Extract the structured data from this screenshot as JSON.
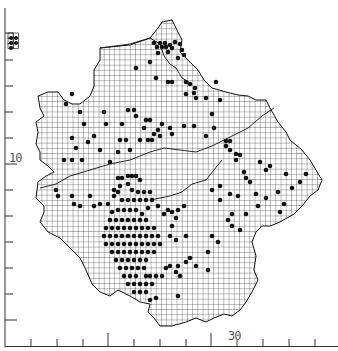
{
  "map": {
    "title": "",
    "grid_cell_px": 5.2,
    "colors": {
      "background": "#ffffff",
      "grid": "#222222",
      "outline": "#111111",
      "dot": "#111111",
      "axis": "#333333",
      "label": "#555555"
    },
    "axis": {
      "y_label": "10",
      "x_label": "30",
      "y_ticks_px": [
        33,
        60,
        86,
        112,
        138,
        164,
        190,
        216,
        242,
        268,
        294,
        320
      ],
      "x_ticks_px": [
        31,
        57,
        83,
        108,
        134,
        160,
        186,
        211,
        237,
        263,
        289,
        315
      ]
    },
    "outline": [
      [
        100,
        48
      ],
      [
        130,
        45
      ],
      [
        150,
        38
      ],
      [
        158,
        28
      ],
      [
        162,
        22
      ],
      [
        172,
        20
      ],
      [
        178,
        32
      ],
      [
        182,
        40
      ],
      [
        180,
        52
      ],
      [
        190,
        62
      ],
      [
        198,
        70
      ],
      [
        204,
        80
      ],
      [
        212,
        88
      ],
      [
        226,
        92
      ],
      [
        238,
        95
      ],
      [
        248,
        96
      ],
      [
        256,
        100
      ],
      [
        266,
        100
      ],
      [
        270,
        108
      ],
      [
        278,
        122
      ],
      [
        286,
        132
      ],
      [
        290,
        140
      ],
      [
        302,
        150
      ],
      [
        310,
        160
      ],
      [
        316,
        170
      ],
      [
        322,
        180
      ],
      [
        318,
        190
      ],
      [
        310,
        196
      ],
      [
        302,
        206
      ],
      [
        294,
        214
      ],
      [
        280,
        222
      ],
      [
        270,
        226
      ],
      [
        262,
        226
      ],
      [
        256,
        232
      ],
      [
        252,
        242
      ],
      [
        256,
        256
      ],
      [
        254,
        270
      ],
      [
        258,
        280
      ],
      [
        252,
        292
      ],
      [
        246,
        302
      ],
      [
        240,
        310
      ],
      [
        232,
        316
      ],
      [
        224,
        314
      ],
      [
        214,
        318
      ],
      [
        206,
        322
      ],
      [
        196,
        318
      ],
      [
        186,
        322
      ],
      [
        172,
        326
      ],
      [
        160,
        326
      ],
      [
        154,
        318
      ],
      [
        148,
        312
      ],
      [
        150,
        304
      ],
      [
        140,
        302
      ],
      [
        130,
        296
      ],
      [
        118,
        290
      ],
      [
        110,
        296
      ],
      [
        100,
        292
      ],
      [
        92,
        284
      ],
      [
        86,
        270
      ],
      [
        80,
        258
      ],
      [
        72,
        250
      ],
      [
        60,
        238
      ],
      [
        48,
        232
      ],
      [
        40,
        222
      ],
      [
        44,
        212
      ],
      [
        44,
        206
      ],
      [
        36,
        198
      ],
      [
        38,
        182
      ],
      [
        46,
        176
      ],
      [
        54,
        172
      ],
      [
        48,
        166
      ],
      [
        40,
        160
      ],
      [
        40,
        152
      ],
      [
        36,
        144
      ],
      [
        38,
        132
      ],
      [
        36,
        122
      ],
      [
        44,
        116
      ],
      [
        40,
        108
      ],
      [
        38,
        96
      ],
      [
        48,
        92
      ],
      [
        58,
        92
      ],
      [
        64,
        100
      ],
      [
        72,
        104
      ],
      [
        80,
        104
      ],
      [
        90,
        96
      ],
      [
        94,
        86
      ],
      [
        94,
        70
      ],
      [
        100,
        60
      ]
    ],
    "inner_boundaries": [
      [
        [
          100,
          48
        ],
        [
          130,
          44
        ],
        [
          150,
          38
        ],
        [
          160,
          44
        ],
        [
          164,
          56
        ],
        [
          170,
          64
        ],
        [
          176,
          68
        ],
        [
          182,
          78
        ],
        [
          192,
          84
        ]
      ],
      [
        [
          40,
          188
        ],
        [
          56,
          184
        ],
        [
          70,
          176
        ],
        [
          90,
          170
        ],
        [
          110,
          164
        ],
        [
          130,
          160
        ],
        [
          150,
          152
        ],
        [
          164,
          148
        ],
        [
          180,
          150
        ],
        [
          196,
          152
        ],
        [
          212,
          146
        ],
        [
          228,
          138
        ],
        [
          248,
          128
        ],
        [
          262,
          116
        ],
        [
          274,
          108
        ]
      ],
      [
        [
          150,
          200
        ],
        [
          170,
          196
        ],
        [
          182,
          192
        ],
        [
          192,
          184
        ],
        [
          206,
          180
        ],
        [
          214,
          170
        ],
        [
          222,
          160
        ]
      ]
    ],
    "inset": {
      "x": 8,
      "y": 33,
      "cols": 2,
      "rows": 3,
      "dots": [
        [
          11,
          38
        ],
        [
          16,
          38
        ],
        [
          11,
          43
        ],
        [
          16,
          43
        ],
        [
          11,
          48
        ]
      ]
    },
    "dots": [
      [
        157,
        47
      ],
      [
        162,
        47
      ],
      [
        166,
        47
      ],
      [
        154,
        43
      ],
      [
        160,
        43
      ],
      [
        165,
        43
      ],
      [
        170,
        45
      ],
      [
        175,
        42
      ],
      [
        172,
        48
      ],
      [
        168,
        52
      ],
      [
        180,
        44
      ],
      [
        182,
        50
      ],
      [
        184,
        55
      ],
      [
        178,
        58
      ],
      [
        158,
        53
      ],
      [
        150,
        62
      ],
      [
        136,
        68
      ],
      [
        156,
        78
      ],
      [
        168,
        82
      ],
      [
        172,
        82
      ],
      [
        186,
        82
      ],
      [
        190,
        84
      ],
      [
        195,
        88
      ],
      [
        194,
        93
      ],
      [
        196,
        98
      ],
      [
        186,
        94
      ],
      [
        206,
        98
      ],
      [
        216,
        82
      ],
      [
        220,
        100
      ],
      [
        212,
        114
      ],
      [
        184,
        126
      ],
      [
        194,
        126
      ],
      [
        214,
        128
      ],
      [
        206,
        136
      ],
      [
        226,
        141
      ],
      [
        230,
        141
      ],
      [
        226,
        146
      ],
      [
        230,
        150
      ],
      [
        236,
        154
      ],
      [
        240,
        155
      ],
      [
        236,
        160
      ],
      [
        246,
        178
      ],
      [
        250,
        182
      ],
      [
        260,
        162
      ],
      [
        266,
        170
      ],
      [
        270,
        166
      ],
      [
        72,
        94
      ],
      [
        66,
        104
      ],
      [
        80,
        112
      ],
      [
        84,
        124
      ],
      [
        104,
        112
      ],
      [
        106,
        124
      ],
      [
        128,
        110
      ],
      [
        134,
        110
      ],
      [
        136,
        116
      ],
      [
        122,
        124
      ],
      [
        146,
        120
      ],
      [
        150,
        120
      ],
      [
        144,
        128
      ],
      [
        154,
        134
      ],
      [
        162,
        124
      ],
      [
        158,
        130
      ],
      [
        170,
        128
      ],
      [
        172,
        134
      ],
      [
        148,
        140
      ],
      [
        152,
        140
      ],
      [
        160,
        136
      ],
      [
        120,
        140
      ],
      [
        126,
        140
      ],
      [
        94,
        136
      ],
      [
        88,
        142
      ],
      [
        72,
        138
      ],
      [
        76,
        148
      ],
      [
        64,
        160
      ],
      [
        72,
        160
      ],
      [
        82,
        160
      ],
      [
        110,
        162
      ],
      [
        118,
        152
      ],
      [
        140,
        140
      ],
      [
        130,
        150
      ],
      [
        100,
        150
      ],
      [
        56,
        190
      ],
      [
        58,
        196
      ],
      [
        72,
        196
      ],
      [
        74,
        204
      ],
      [
        80,
        206
      ],
      [
        90,
        196
      ],
      [
        94,
        206
      ],
      [
        100,
        204
      ],
      [
        108,
        204
      ],
      [
        114,
        196
      ],
      [
        118,
        178
      ],
      [
        122,
        178
      ],
      [
        128,
        176
      ],
      [
        132,
        176
      ],
      [
        136,
        176
      ],
      [
        140,
        180
      ],
      [
        128,
        184
      ],
      [
        120,
        186
      ],
      [
        114,
        190
      ],
      [
        132,
        190
      ],
      [
        138,
        192
      ],
      [
        144,
        192
      ],
      [
        150,
        192
      ],
      [
        152,
        200
      ],
      [
        148,
        208
      ],
      [
        142,
        214
      ],
      [
        158,
        206
      ],
      [
        164,
        214
      ],
      [
        168,
        210
      ],
      [
        172,
        212
      ],
      [
        176,
        218
      ],
      [
        178,
        210
      ],
      [
        184,
        206
      ],
      [
        172,
        226
      ],
      [
        170,
        236
      ],
      [
        176,
        240
      ],
      [
        186,
        236
      ],
      [
        112,
        212
      ],
      [
        118,
        210
      ],
      [
        124,
        210
      ],
      [
        130,
        210
      ],
      [
        136,
        210
      ],
      [
        110,
        220
      ],
      [
        116,
        220
      ],
      [
        122,
        220
      ],
      [
        128,
        220
      ],
      [
        134,
        220
      ],
      [
        140,
        220
      ],
      [
        146,
        220
      ],
      [
        106,
        228
      ],
      [
        112,
        228
      ],
      [
        118,
        228
      ],
      [
        124,
        228
      ],
      [
        130,
        228
      ],
      [
        136,
        228
      ],
      [
        142,
        228
      ],
      [
        148,
        228
      ],
      [
        154,
        228
      ],
      [
        104,
        236
      ],
      [
        110,
        236
      ],
      [
        116,
        236
      ],
      [
        122,
        236
      ],
      [
        128,
        236
      ],
      [
        134,
        236
      ],
      [
        140,
        236
      ],
      [
        146,
        236
      ],
      [
        152,
        236
      ],
      [
        158,
        236
      ],
      [
        106,
        244
      ],
      [
        112,
        244
      ],
      [
        118,
        244
      ],
      [
        124,
        244
      ],
      [
        130,
        244
      ],
      [
        136,
        244
      ],
      [
        142,
        244
      ],
      [
        148,
        244
      ],
      [
        154,
        244
      ],
      [
        160,
        244
      ],
      [
        112,
        252
      ],
      [
        118,
        252
      ],
      [
        124,
        252
      ],
      [
        130,
        252
      ],
      [
        136,
        252
      ],
      [
        142,
        252
      ],
      [
        148,
        252
      ],
      [
        154,
        252
      ],
      [
        116,
        260
      ],
      [
        122,
        260
      ],
      [
        128,
        260
      ],
      [
        134,
        260
      ],
      [
        140,
        260
      ],
      [
        146,
        260
      ],
      [
        120,
        268
      ],
      [
        126,
        268
      ],
      [
        132,
        268
      ],
      [
        138,
        268
      ],
      [
        144,
        268
      ],
      [
        124,
        276
      ],
      [
        130,
        276
      ],
      [
        136,
        276
      ],
      [
        146,
        276
      ],
      [
        150,
        276
      ],
      [
        156,
        276
      ],
      [
        162,
        276
      ],
      [
        128,
        284
      ],
      [
        134,
        284
      ],
      [
        140,
        284
      ],
      [
        146,
        284
      ],
      [
        152,
        284
      ],
      [
        134,
        292
      ],
      [
        140,
        292
      ],
      [
        146,
        292
      ],
      [
        150,
        300
      ],
      [
        156,
        298
      ],
      [
        122,
        200
      ],
      [
        128,
        200
      ],
      [
        134,
        200
      ],
      [
        140,
        200
      ],
      [
        146,
        200
      ],
      [
        118,
        192
      ],
      [
        176,
        272
      ],
      [
        180,
        276
      ],
      [
        166,
        268
      ],
      [
        170,
        266
      ],
      [
        178,
        266
      ],
      [
        186,
        262
      ],
      [
        190,
        258
      ],
      [
        196,
        266
      ],
      [
        178,
        296
      ],
      [
        208,
        270
      ],
      [
        208,
        252
      ],
      [
        212,
        236
      ],
      [
        218,
        242
      ],
      [
        228,
        220
      ],
      [
        232,
        214
      ],
      [
        232,
        226
      ],
      [
        240,
        230
      ],
      [
        246,
        214
      ],
      [
        258,
        206
      ],
      [
        266,
        198
      ],
      [
        280,
        212
      ],
      [
        284,
        204
      ],
      [
        292,
        188
      ],
      [
        300,
        182
      ],
      [
        306,
        174
      ],
      [
        286,
        174
      ],
      [
        278,
        192
      ],
      [
        256,
        194
      ],
      [
        238,
        196
      ],
      [
        230,
        194
      ],
      [
        220,
        186
      ],
      [
        212,
        190
      ],
      [
        220,
        200
      ],
      [
        244,
        172
      ]
    ]
  }
}
